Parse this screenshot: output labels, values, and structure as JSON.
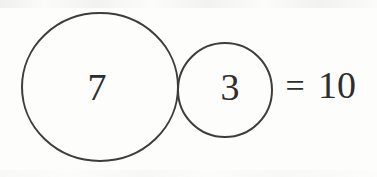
{
  "figure": {
    "left_circle_value": "7",
    "right_circle_value": "3",
    "equals_sign": "=",
    "result_value": "10"
  },
  "colors": {
    "circle_stroke": "#3d3d3d",
    "text": "#2e2e2e",
    "background": "#fdfdfc"
  }
}
